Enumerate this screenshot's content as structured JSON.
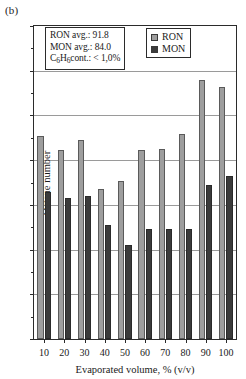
{
  "panel_label": "(b)",
  "annotation": {
    "line1": "RON avg.: 91.8",
    "line2": "MON avg.: 84.0",
    "line3_prefix": "C",
    "line3_sub1": "6",
    "line3_mid": "H",
    "line3_sub2": "6",
    "line3_suffix": "cont.: < 1,0%"
  },
  "legend": {
    "position": "inside-top-right",
    "entries": [
      {
        "label": "RON",
        "swatch": "ron",
        "color": "#9e9e9e"
      },
      {
        "label": "MON",
        "swatch": "mon",
        "color": "#3b3b3b"
      }
    ]
  },
  "chart_data": {
    "type": "bar",
    "title": "",
    "subtitle": "",
    "xlabel": "Evaporated volume, % (v/v)",
    "ylabel": "Octane number",
    "categories": [
      "10",
      "20",
      "30",
      "40",
      "50",
      "60",
      "70",
      "80",
      "90",
      "100"
    ],
    "series": [
      {
        "name": "RON",
        "color": "#9e9e9e",
        "values": [
          92.7,
          91.1,
          92.2,
          86.8,
          87.7,
          91.1,
          91.3,
          92.9,
          99.0,
          98.2
        ]
      },
      {
        "name": "MON",
        "color": "#3b3b3b",
        "values": [
          86.4,
          85.8,
          86.0,
          82.8,
          80.5,
          82.3,
          82.3,
          82.3,
          87.2,
          88.2
        ]
      }
    ],
    "ylim": [
      70,
      105
    ],
    "yticks": [
      70,
      75,
      80,
      85,
      90,
      95,
      100,
      105
    ],
    "ytick_labels": [
      "70",
      "75",
      "80",
      "85",
      "90",
      "95",
      "100",
      "105"
    ],
    "y_minor_step": 2.5,
    "grid": "horizontal",
    "xtick_labels": [
      "10",
      "20",
      "30",
      "40",
      "50",
      "60",
      "70",
      "80",
      "90",
      "100"
    ]
  }
}
